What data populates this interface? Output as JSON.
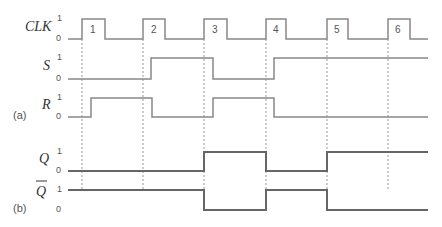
{
  "signals": {
    "clk": {
      "label": "CLK",
      "hi": "1",
      "lo": "0"
    },
    "s": {
      "label": "S",
      "hi": "1",
      "lo": "0"
    },
    "r": {
      "label": "R",
      "hi": "1",
      "lo": "0"
    },
    "q": {
      "label": "Q",
      "hi": "1",
      "lo": "0"
    },
    "qbar": {
      "label": "Q",
      "hi": "1",
      "lo": "0"
    }
  },
  "parts": {
    "a": "(a)",
    "b": "(b)"
  },
  "pulses": [
    "1",
    "2",
    "3",
    "4",
    "5",
    "6"
  ],
  "colors": {
    "line": "#888888",
    "bold": "#666666",
    "text": "#333333"
  }
}
